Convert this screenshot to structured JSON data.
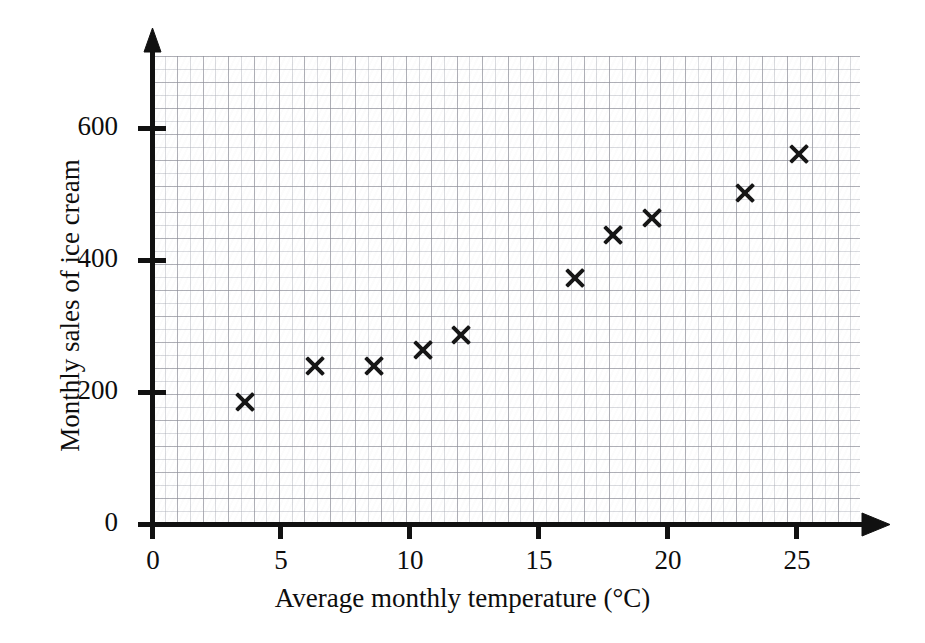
{
  "chart_data": {
    "type": "scatter",
    "title": "",
    "xlabel": "Average monthly temperature (°C)",
    "ylabel": "Monthly sales of ice cream",
    "xlim": [
      0,
      27.9
    ],
    "ylim": [
      0,
      710
    ],
    "xticks": [
      0,
      5,
      10,
      15,
      20,
      25
    ],
    "xtick_labels": [
      "0",
      "5",
      "10",
      "15",
      "20",
      "25"
    ],
    "yticks": [
      0,
      200,
      400,
      600
    ],
    "ytick_labels": [
      "0",
      "200",
      "400",
      "600"
    ],
    "grid": true,
    "grid_style": "graph-paper minor 1 unit / major 2 units",
    "legend": "none",
    "marker": "x",
    "marker_color": "#161616",
    "points": [
      {
        "x": 3.6,
        "y": 186
      },
      {
        "x": 6.3,
        "y": 240
      },
      {
        "x": 8.6,
        "y": 240
      },
      {
        "x": 10.5,
        "y": 264
      },
      {
        "x": 12.0,
        "y": 287
      },
      {
        "x": 16.4,
        "y": 373
      },
      {
        "x": 17.9,
        "y": 438
      },
      {
        "x": 19.4,
        "y": 465
      },
      {
        "x": 23.0,
        "y": 503
      },
      {
        "x": 25.1,
        "y": 562
      }
    ]
  },
  "axis": {
    "x_title": "Average monthly temperature (°C)",
    "y_title": "Monthly sales of ice cream",
    "axis_color": "#111111"
  }
}
